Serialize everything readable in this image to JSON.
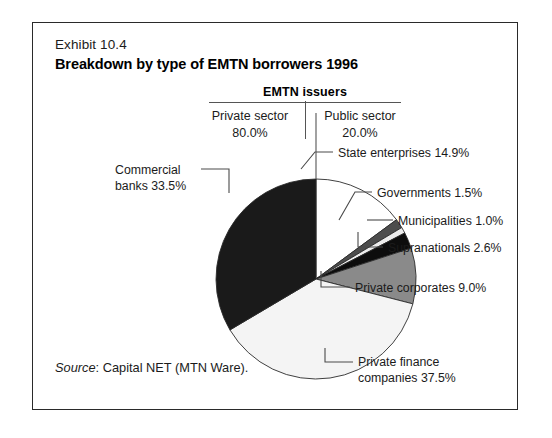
{
  "exhibit": {
    "number": "Exhibit 10.4",
    "title": "Breakdown by type of EMTN borrowers 1996",
    "source_word": "Source",
    "source_rest": ": Capital NET (MTN Ware)."
  },
  "issuers": {
    "heading": "EMTN issuers",
    "columns": [
      {
        "name": "Private sector",
        "percent": "80.0%"
      },
      {
        "name": "Public sector",
        "percent": "20.0%"
      }
    ]
  },
  "labels": {
    "commercial_banks_l1": "Commercial",
    "commercial_banks_l2": "banks 33.5%",
    "state_enterprises": "State enterprises 14.9%",
    "governments": "Governments 1.5%",
    "municipalities": "Municipalities 1.0%",
    "supranationals": "Supranationals 2.6%",
    "private_corporates": "Private corporates 9.0%",
    "private_finance_l1": "Private finance",
    "private_finance_l2": "companies 37.5%"
  },
  "chart_data": {
    "type": "pie",
    "title": "Breakdown by type of EMTN borrowers 1996",
    "subtitle": "EMTN issuers",
    "units": "percent",
    "start_angle_deg": 0,
    "direction": "clockwise",
    "legend": "callout-labels",
    "grid": false,
    "center": {
      "x": 283,
      "y": 256
    },
    "radius": 100,
    "groups": [
      {
        "name": "Private sector",
        "value": 80.0
      },
      {
        "name": "Public sector",
        "value": 20.0
      }
    ],
    "categories": [
      "State enterprises",
      "Governments",
      "Municipalities",
      "Supranationals",
      "Private corporates",
      "Private finance companies",
      "Commercial banks"
    ],
    "values": [
      14.9,
      1.5,
      1.0,
      2.6,
      9.0,
      37.5,
      33.5
    ],
    "slices": [
      {
        "label": "State enterprises",
        "value": 14.9,
        "group": "Public sector",
        "color": "#ffffff",
        "start_deg": 0.0,
        "end_deg": 53.64
      },
      {
        "label": "Governments",
        "value": 1.5,
        "group": "Public sector",
        "color": "#4d4d4d",
        "start_deg": 53.64,
        "end_deg": 59.04
      },
      {
        "label": "Municipalities",
        "value": 1.0,
        "group": "Public sector",
        "color": "#ededed",
        "start_deg": 59.04,
        "end_deg": 62.64
      },
      {
        "label": "Supranationals",
        "value": 2.6,
        "group": "Public sector",
        "color": "#0d0d0d",
        "start_deg": 62.64,
        "end_deg": 72.0
      },
      {
        "label": "Private corporates",
        "value": 9.0,
        "group": "Private sector",
        "color": "#8a8a8a",
        "start_deg": 72.0,
        "end_deg": 104.4
      },
      {
        "label": "Private finance companies",
        "value": 37.5,
        "group": "Private sector",
        "color": "#f4f4f4",
        "start_deg": 104.4,
        "end_deg": 239.4
      },
      {
        "label": "Commercial banks",
        "value": 33.5,
        "group": "Private sector",
        "color": "#1a1a1a",
        "start_deg": 239.4,
        "end_deg": 360.0
      }
    ]
  },
  "colors": {
    "frame": "#2a2a2a",
    "text": "#1b1b1b",
    "rule": "#555555",
    "leader": "#4a4a4a"
  }
}
